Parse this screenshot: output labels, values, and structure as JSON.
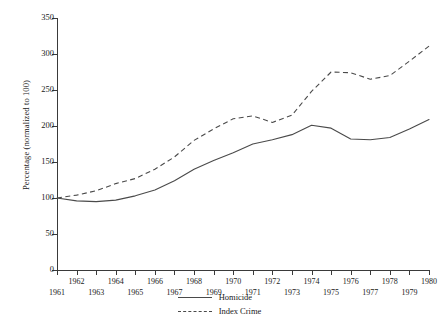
{
  "chart_data": {
    "type": "line",
    "title": "",
    "xlabel": "",
    "ylabel": "Percentage (normalized to 100)",
    "xlim": [
      1961,
      1980
    ],
    "ylim": [
      0,
      350
    ],
    "yticks": [
      0,
      50,
      100,
      150,
      200,
      250,
      300,
      350
    ],
    "grid": false,
    "legend_position": "bottom-center",
    "x": [
      1961,
      1962,
      1963,
      1964,
      1965,
      1966,
      1967,
      1968,
      1969,
      1970,
      1971,
      1972,
      1973,
      1974,
      1975,
      1976,
      1977,
      1978,
      1979,
      1980
    ],
    "categories": [
      "1961",
      "1962",
      "1963",
      "1964",
      "1965",
      "1966",
      "1967",
      "1968",
      "1969",
      "1970",
      "1971",
      "1972",
      "1973",
      "1974",
      "1975",
      "1976",
      "1977",
      "1978",
      "1979",
      "1980"
    ],
    "series": [
      {
        "name": "Homicide",
        "style": "solid",
        "color": "#4a4a4a",
        "values": [
          100,
          96,
          95,
          97,
          103,
          111,
          124,
          140,
          152,
          163,
          175,
          181,
          188,
          201,
          197,
          182,
          181,
          184,
          196,
          209
        ]
      },
      {
        "name": "Index Crime",
        "style": "dashed",
        "color": "#4a4a4a",
        "values": [
          100,
          104,
          110,
          120,
          127,
          140,
          157,
          180,
          196,
          210,
          214,
          205,
          215,
          248,
          275,
          274,
          265,
          270,
          290,
          311
        ]
      }
    ]
  },
  "axes": {
    "y_title": "Percentage (normalized to 100)",
    "y_tick_labels": [
      "0",
      "50",
      "100",
      "150",
      "200",
      "250",
      "300",
      "350"
    ],
    "x_tick_labels_top_row": [
      "1962",
      "1964",
      "1966",
      "1968",
      "1970",
      "1972",
      "1974",
      "1976",
      "1978",
      "1980"
    ],
    "x_tick_labels_bottom_row": [
      "1961",
      "1963",
      "1965",
      "1967",
      "1969",
      "1971",
      "1973",
      "1975",
      "1977",
      "1979"
    ]
  },
  "legend": {
    "entries": [
      {
        "label": "Homicide",
        "style": "solid"
      },
      {
        "label": "Index Crime",
        "style": "dashed"
      }
    ]
  },
  "colors": {
    "line": "#4a4a4a",
    "axis": "#3a3a3a",
    "text": "#1a1a1a",
    "background": "#ffffff"
  }
}
